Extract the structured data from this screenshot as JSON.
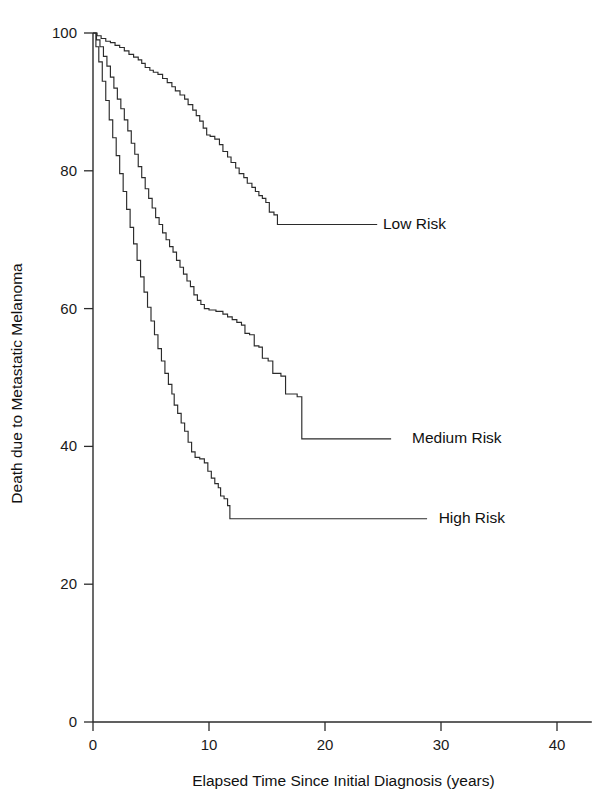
{
  "chart_data": {
    "type": "line",
    "subtype": "kaplan-meier-step",
    "title": "",
    "xlabel": "Elapsed Time Since Initial Diagnosis (years)",
    "ylabel": "Death due to Metastatic Melanoma",
    "xlim": [
      0,
      43
    ],
    "ylim": [
      0,
      100
    ],
    "xticks": [
      0,
      10,
      20,
      30,
      40
    ],
    "xticklabels": [
      "0",
      "10",
      "20",
      "30",
      "40"
    ],
    "yticks": [
      0,
      20,
      40,
      60,
      80,
      100
    ],
    "yticklabels": [
      "0",
      "20",
      "40",
      "60",
      "80",
      "100"
    ],
    "grid": false,
    "legend_position": "right-inline-leader-lines",
    "line_color": "#2b2b2b",
    "series": [
      {
        "name": "Low Risk",
        "label_x": 25.0,
        "label_y": 72.2,
        "leader_end_x": 24.5,
        "plateau_value": 72.2,
        "plateau_start_x": 16.1,
        "points": [
          [
            0.0,
            100.0
          ],
          [
            0.35,
            99.6
          ],
          [
            0.7,
            99.2
          ],
          [
            1.1,
            98.8
          ],
          [
            1.5,
            98.6
          ],
          [
            1.9,
            98.2
          ],
          [
            2.3,
            97.9
          ],
          [
            2.7,
            97.4
          ],
          [
            3.1,
            96.9
          ],
          [
            3.5,
            96.5
          ],
          [
            3.9,
            96.1
          ],
          [
            4.2,
            95.6
          ],
          [
            4.5,
            95.0
          ],
          [
            4.9,
            94.6
          ],
          [
            5.2,
            94.3
          ],
          [
            5.6,
            94.0
          ],
          [
            6.0,
            93.4
          ],
          [
            6.4,
            92.8
          ],
          [
            6.8,
            92.2
          ],
          [
            7.1,
            91.6
          ],
          [
            7.5,
            91.0
          ],
          [
            7.9,
            90.4
          ],
          [
            8.2,
            89.6
          ],
          [
            8.6,
            88.8
          ],
          [
            8.9,
            88.0
          ],
          [
            9.2,
            87.2
          ],
          [
            9.5,
            86.2
          ],
          [
            9.8,
            85.2
          ],
          [
            10.1,
            85.0
          ],
          [
            10.5,
            84.6
          ],
          [
            10.9,
            83.8
          ],
          [
            11.2,
            82.8
          ],
          [
            11.6,
            82.0
          ],
          [
            11.9,
            81.2
          ],
          [
            12.3,
            80.4
          ],
          [
            12.6,
            79.6
          ],
          [
            13.0,
            79.0
          ],
          [
            13.3,
            78.2
          ],
          [
            13.7,
            77.6
          ],
          [
            14.0,
            77.0
          ],
          [
            14.3,
            76.4
          ],
          [
            14.6,
            76.0
          ],
          [
            14.9,
            75.4
          ],
          [
            15.2,
            74.0
          ],
          [
            15.6,
            73.6
          ],
          [
            15.9,
            72.2
          ],
          [
            16.1,
            72.2
          ],
          [
            24.5,
            72.2
          ]
        ]
      },
      {
        "name": "Medium Risk",
        "label_x": 27.5,
        "label_y": 41.1,
        "leader_end_x": 25.7,
        "plateau_value": 41.1,
        "plateau_start_x": 18.3,
        "points": [
          [
            0.0,
            100.0
          ],
          [
            0.3,
            99.0
          ],
          [
            0.6,
            98.0
          ],
          [
            0.9,
            96.6
          ],
          [
            1.2,
            95.2
          ],
          [
            1.5,
            93.6
          ],
          [
            1.8,
            92.0
          ],
          [
            2.1,
            90.4
          ],
          [
            2.4,
            89.0
          ],
          [
            2.7,
            87.4
          ],
          [
            3.0,
            85.8
          ],
          [
            3.3,
            84.0
          ],
          [
            3.6,
            82.4
          ],
          [
            3.9,
            80.6
          ],
          [
            4.2,
            79.0
          ],
          [
            4.5,
            77.4
          ],
          [
            4.8,
            76.0
          ],
          [
            5.1,
            74.6
          ],
          [
            5.4,
            73.2
          ],
          [
            5.7,
            72.2
          ],
          [
            6.0,
            71.0
          ],
          [
            6.3,
            70.0
          ],
          [
            6.6,
            69.0
          ],
          [
            6.9,
            68.2
          ],
          [
            7.2,
            67.0
          ],
          [
            7.5,
            66.0
          ],
          [
            7.8,
            65.0
          ],
          [
            8.1,
            64.0
          ],
          [
            8.4,
            63.2
          ],
          [
            8.7,
            62.0
          ],
          [
            9.0,
            61.2
          ],
          [
            9.3,
            60.6
          ],
          [
            9.6,
            60.0
          ],
          [
            10.0,
            59.8
          ],
          [
            10.6,
            59.6
          ],
          [
            11.2,
            59.2
          ],
          [
            11.6,
            58.8
          ],
          [
            12.0,
            58.4
          ],
          [
            12.4,
            58.0
          ],
          [
            12.8,
            57.6
          ],
          [
            13.1,
            56.4
          ],
          [
            13.5,
            56.2
          ],
          [
            13.9,
            54.6
          ],
          [
            14.3,
            54.4
          ],
          [
            14.6,
            52.8
          ],
          [
            15.1,
            52.4
          ],
          [
            15.5,
            50.6
          ],
          [
            16.2,
            50.2
          ],
          [
            16.6,
            47.6
          ],
          [
            17.6,
            47.2
          ],
          [
            18.0,
            41.1
          ],
          [
            18.3,
            41.1
          ],
          [
            25.7,
            41.1
          ]
        ]
      },
      {
        "name": "High Risk",
        "label_x": 29.8,
        "label_y": 29.5,
        "leader_end_x": 28.8,
        "plateau_value": 29.5,
        "plateau_start_x": 12.0,
        "points": [
          [
            0.0,
            100.0
          ],
          [
            0.25,
            98.0
          ],
          [
            0.5,
            95.8
          ],
          [
            0.8,
            93.0
          ],
          [
            1.1,
            90.2
          ],
          [
            1.4,
            87.4
          ],
          [
            1.7,
            84.8
          ],
          [
            2.0,
            82.2
          ],
          [
            2.3,
            79.6
          ],
          [
            2.6,
            77.0
          ],
          [
            2.9,
            74.4
          ],
          [
            3.2,
            71.8
          ],
          [
            3.5,
            69.4
          ],
          [
            3.8,
            67.0
          ],
          [
            4.1,
            64.6
          ],
          [
            4.4,
            62.4
          ],
          [
            4.7,
            60.2
          ],
          [
            5.0,
            58.2
          ],
          [
            5.3,
            56.2
          ],
          [
            5.6,
            54.2
          ],
          [
            5.9,
            52.4
          ],
          [
            6.2,
            50.6
          ],
          [
            6.5,
            49.0
          ],
          [
            6.8,
            47.6
          ],
          [
            7.0,
            46.0
          ],
          [
            7.3,
            44.8
          ],
          [
            7.6,
            43.4
          ],
          [
            7.9,
            42.2
          ],
          [
            8.2,
            40.6
          ],
          [
            8.5,
            39.2
          ],
          [
            8.8,
            38.4
          ],
          [
            9.2,
            38.2
          ],
          [
            9.6,
            37.6
          ],
          [
            9.9,
            36.4
          ],
          [
            10.2,
            35.4
          ],
          [
            10.5,
            34.6
          ],
          [
            10.8,
            34.0
          ],
          [
            11.0,
            32.8
          ],
          [
            11.3,
            32.4
          ],
          [
            11.6,
            31.4
          ],
          [
            11.8,
            29.5
          ],
          [
            12.0,
            29.5
          ],
          [
            28.8,
            29.5
          ]
        ]
      }
    ]
  },
  "labels": {
    "series_low": "Low Risk",
    "series_medium": "Medium Risk",
    "series_high": "High Risk"
  }
}
